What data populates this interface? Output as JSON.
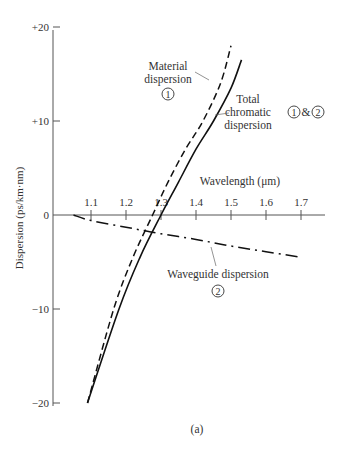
{
  "chart_data": {
    "type": "line",
    "title": "",
    "caption": "(a)",
    "xlabel": "Wavelength (μm)",
    "ylabel": "Dispersion (ps/km·nm)",
    "xlim": [
      1.05,
      1.75
    ],
    "ylim": [
      -20,
      20
    ],
    "xticks": [
      "1.1",
      "1.2",
      "1.3",
      "1.4",
      "1.5",
      "1.6",
      "1.7"
    ],
    "yticks": [
      "+20",
      "+10",
      "0",
      "-10",
      "-20"
    ],
    "grid": false,
    "legend": "inline annotations",
    "series": [
      {
        "name": "Material dispersion",
        "marker": "1",
        "style": "dashed",
        "x": [
          1.09,
          1.165,
          1.22,
          1.276,
          1.32,
          1.37,
          1.42,
          1.47,
          1.5
        ],
        "y": [
          -20,
          -10,
          -4.5,
          0,
          3.5,
          7,
          10,
          14,
          18
        ]
      },
      {
        "name": "Total chromatic dispersion",
        "marker": "1 & 2",
        "style": "solid",
        "x": [
          1.09,
          1.18,
          1.24,
          1.3,
          1.35,
          1.4,
          1.45,
          1.5,
          1.53
        ],
        "y": [
          -20,
          -10,
          -4.5,
          0,
          3.5,
          7,
          10,
          13.5,
          16.5
        ]
      },
      {
        "name": "Waveguide dispersion",
        "marker": "2",
        "style": "dash-dot",
        "x": [
          1.05,
          1.1,
          1.2,
          1.3,
          1.4,
          1.5,
          1.6,
          1.7
        ],
        "y": [
          0,
          -0.6,
          -1.3,
          -2.0,
          -2.6,
          -3.3,
          -3.9,
          -4.5
        ]
      }
    ],
    "annotations": [
      {
        "text": [
          "Material",
          "dispersion"
        ],
        "marker": "1"
      },
      {
        "text": [
          "Total",
          "chromatic",
          "dispersion"
        ],
        "marker": "1 & 2"
      },
      {
        "text": [
          "Waveguide dispersion"
        ],
        "marker": "2"
      }
    ]
  },
  "labels": {
    "xlabel": "Wavelength (μm)",
    "ylabel": "Dispersion (ps/km·nm)",
    "caption": "(a)",
    "material_line1": "Material",
    "material_line2": "dispersion",
    "material_marker": "1",
    "total_line1": "Total",
    "total_line2": "chromatic",
    "total_line3": "dispersion",
    "total_marker_a": "1",
    "total_amp": "&",
    "total_marker_b": "2",
    "waveguide_line1": "Waveguide dispersion",
    "waveguide_marker": "2"
  }
}
